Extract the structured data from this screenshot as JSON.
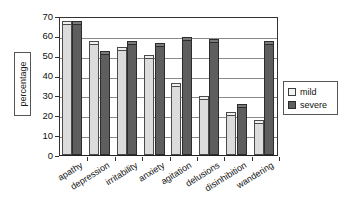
{
  "chart_data": {
    "type": "bar",
    "title": "",
    "subtitle": "",
    "xlabel": "",
    "ylabel": "percentage",
    "ylim": [
      0,
      70
    ],
    "yticks": [
      0,
      10,
      20,
      30,
      40,
      50,
      60,
      70
    ],
    "grid": "horizontal",
    "legend_position": "right",
    "orientation": "vertical",
    "grouping": "grouped",
    "categories": [
      "apathy",
      "depression",
      "irritability",
      "anxiety",
      "agitation",
      "delusions",
      "disinhibition",
      "wandering"
    ],
    "series": [
      {
        "name": "mild",
        "color": "#dcdcdc",
        "values": [
          66,
          56,
          53,
          49,
          35,
          28,
          20,
          16
        ]
      },
      {
        "name": "severe",
        "color": "#5e5e5e",
        "values": [
          66,
          51,
          56,
          55,
          58,
          57,
          24,
          56
        ]
      }
    ],
    "annotations": []
  },
  "legend": {
    "items": [
      {
        "label": "mild",
        "swatch": "mild"
      },
      {
        "label": "severe",
        "swatch": "severe"
      }
    ]
  },
  "axis": {
    "y_title": "percentage"
  }
}
